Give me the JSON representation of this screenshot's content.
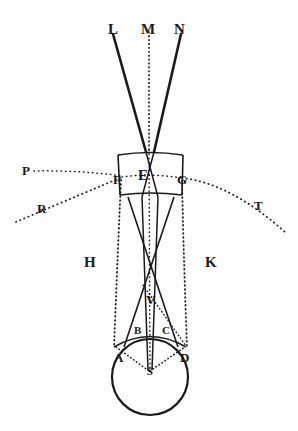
{
  "figure": {
    "background_color": "#fefefe",
    "ink_color": "#1a1a1a",
    "width": 298,
    "height": 431,
    "labels": [
      {
        "id": "L",
        "text": "L",
        "x": 108,
        "y": 22,
        "size": "lbl-lg",
        "role": "ray-endpoint-label"
      },
      {
        "id": "M",
        "text": "M",
        "x": 142,
        "y": 22,
        "size": "lbl-lg",
        "role": "ray-endpoint-label"
      },
      {
        "id": "N",
        "text": "N",
        "x": 174,
        "y": 22,
        "size": "lbl-lg",
        "role": "ray-endpoint-label"
      },
      {
        "id": "P",
        "text": "P",
        "x": 22,
        "y": 164,
        "size": "lbl-md",
        "role": "arc-endpoint-label"
      },
      {
        "id": "F",
        "text": "F",
        "x": 115,
        "y": 172,
        "size": "lbl-md",
        "role": "lens-edge-label"
      },
      {
        "id": "E",
        "text": "E",
        "x": 140,
        "y": 169,
        "size": "lbl-lg",
        "role": "lens-center-label"
      },
      {
        "id": "G",
        "text": "G",
        "x": 178,
        "y": 172,
        "size": "lbl-md",
        "role": "lens-edge-label"
      },
      {
        "id": "T",
        "text": "T",
        "x": 255,
        "y": 200,
        "size": "lbl-md",
        "role": "arc-endpoint-label"
      },
      {
        "id": "R",
        "text": "R",
        "x": 38,
        "y": 202,
        "size": "lbl-md",
        "role": "arc-endpoint-label"
      },
      {
        "id": "H",
        "text": "H",
        "x": 85,
        "y": 255,
        "size": "lbl-lg",
        "role": "region-label"
      },
      {
        "id": "K",
        "text": "K",
        "x": 205,
        "y": 255,
        "size": "lbl-lg",
        "role": "region-label"
      },
      {
        "id": "V",
        "text": "V",
        "x": 147,
        "y": 293,
        "size": "lbl-md",
        "role": "crossing-point-label"
      },
      {
        "id": "B",
        "text": "B",
        "x": 135,
        "y": 325,
        "size": "lbl-sm",
        "role": "sphere-arc-label"
      },
      {
        "id": "C",
        "text": "C",
        "x": 162,
        "y": 325,
        "size": "lbl-sm",
        "role": "sphere-arc-label"
      },
      {
        "id": "A",
        "text": "A",
        "x": 115,
        "y": 352,
        "size": "lbl-md",
        "role": "sphere-arc-label"
      },
      {
        "id": "D",
        "text": "D",
        "x": 180,
        "y": 352,
        "size": "lbl-md",
        "role": "sphere-arc-label"
      },
      {
        "id": "S",
        "text": "S",
        "x": 147,
        "y": 364,
        "size": "lbl-it",
        "role": "sphere-center-label"
      }
    ],
    "elements": {
      "sphere": {
        "name": "luminous-sphere",
        "center_x": 150,
        "center_y": 377,
        "radius": 38
      },
      "lens": {
        "name": "refracting-lens",
        "top": 152,
        "bottom": 196,
        "left": 117,
        "right": 184
      },
      "rays_solid": [
        "ray-L",
        "ray-N",
        "ray-F-to-C",
        "ray-G-to-B",
        "ray-E-to-S-left",
        "ray-E-to-S-right"
      ],
      "rays_dotted": [
        "ray-M-axis",
        "arc-P-F",
        "arc-R-F-E-G-T",
        "line-F-to-A",
        "line-G-to-D",
        "line-A-S",
        "line-S-D",
        "line-V-D"
      ]
    }
  }
}
